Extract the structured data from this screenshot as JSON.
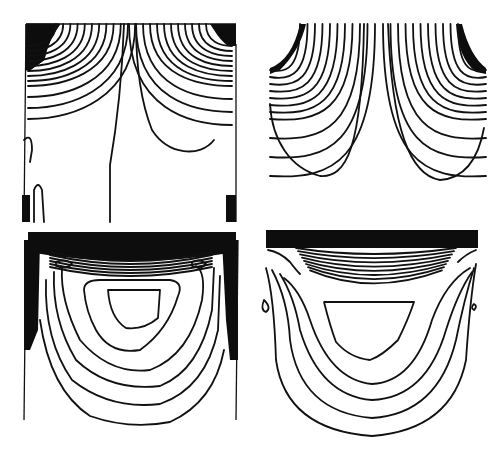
{
  "figure": {
    "ink_color": "#111111",
    "background_color": "#ffffff",
    "panels": [
      {
        "id": "top-left",
        "pattern": "two symmetric lobes with dense contours at top corners, a central near-vertical contour line, small cells at bottom corners"
      },
      {
        "id": "top-right",
        "pattern": "two symmetric U-shaped lobes with dense contours at top corners, open bottom"
      },
      {
        "id": "bottom-left",
        "pattern": "nested U-shaped contours under a dense band at the top, closed inner cell, noisy side walls"
      },
      {
        "id": "bottom-right",
        "pattern": "nested U-shaped contours under a solid dense band at the top, closed inner cell, small drops at sides"
      }
    ]
  }
}
